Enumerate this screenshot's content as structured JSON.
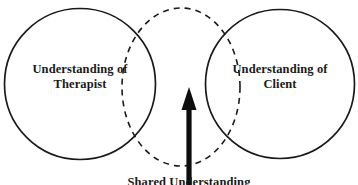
{
  "diagram": {
    "type": "venn",
    "background_color": "#ffffff",
    "stroke_color": "#1a1a1a",
    "left_circle": {
      "style": "solid",
      "label_line1": "Understanding of",
      "label_line2": "Therapist"
    },
    "right_circle": {
      "style": "solid",
      "label_line1": "Understanding of",
      "label_line2": "Client"
    },
    "overlap_circle": {
      "style": "dashed",
      "label": "Shared Understanding"
    },
    "arrow": {
      "direction": "up",
      "color": "#0d0d0d",
      "points_to": "overlap-region"
    }
  }
}
